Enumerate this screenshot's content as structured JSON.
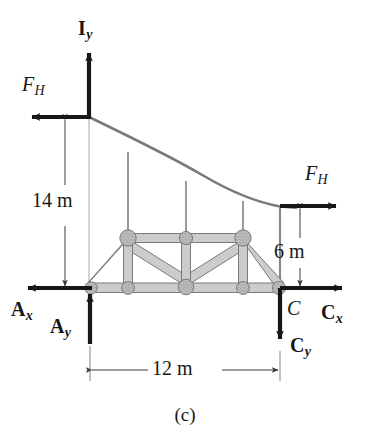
{
  "figure": {
    "caption": "(c)",
    "background_color": "#ffffff",
    "ink_color": "#171717",
    "member_fill": "#c9c9c9",
    "member_edge": "#6e6e6e",
    "cable_color": "#7a7a7a",
    "hanger_color": "#8a8a8a",
    "dimension_color": "#3a3a3a"
  },
  "labels": {
    "force_iy": {
      "base": "I",
      "sub": "y",
      "style": "bold"
    },
    "force_fh_left": {
      "base": "F",
      "sub": "H",
      "style": "italic"
    },
    "force_fh_right": {
      "base": "F",
      "sub": "H",
      "style": "italic"
    },
    "force_ax": {
      "base": "A",
      "sub": "x",
      "style": "bold"
    },
    "force_ay": {
      "base": "A",
      "sub": "y",
      "style": "bold"
    },
    "force_cx": {
      "base": "C",
      "sub": "x",
      "style": "bold"
    },
    "force_cy": {
      "base": "C",
      "sub": "y",
      "style": "bold"
    },
    "point_c": {
      "base": "C",
      "sub": "",
      "style": "italic"
    }
  },
  "dimensions": {
    "height_left": {
      "value": "14 m",
      "orientation": "vertical"
    },
    "height_right": {
      "value": "6 m",
      "orientation": "vertical"
    },
    "span_bottom": {
      "value": "12 m",
      "orientation": "horizontal"
    }
  },
  "geometry": {
    "tower_x": 89,
    "baseline_y": 288,
    "cable_left_y": 117,
    "cable_right_x": 280,
    "cable_right_y": 206,
    "truss_left_x": 90,
    "truss_right_x": 280,
    "truss_top_y": 238,
    "truss_bottom_y": 288,
    "top_chord_left_x": 128,
    "top_chord_right_x": 243,
    "hanger_x": [
      128,
      186,
      243
    ],
    "bottom_nodes_x": [
      90,
      128,
      186,
      243,
      280
    ],
    "top_nodes_x": [
      128,
      186,
      243
    ]
  },
  "arrows": {
    "iy": {
      "direction": "up",
      "x": 89,
      "from_y": 117,
      "to_y": 48
    },
    "fh_left": {
      "direction": "left",
      "y": 117,
      "from_x": 89,
      "to_x": 27
    },
    "fh_right": {
      "direction": "right",
      "y": 206,
      "from_x": 280,
      "to_x": 342
    },
    "ax": {
      "direction": "left",
      "y": 288,
      "from_x": 90,
      "to_x": 22
    },
    "ay": {
      "direction": "up",
      "x": 90,
      "from_y": 344,
      "to_y": 288
    },
    "cx": {
      "direction": "right",
      "y": 288,
      "from_x": 280,
      "to_x": 348
    },
    "cy": {
      "direction": "down",
      "x": 280,
      "from_y": 288,
      "to_y": 345
    }
  }
}
